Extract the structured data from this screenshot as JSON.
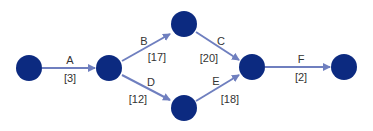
{
  "diagram": {
    "type": "activity-network",
    "colors": {
      "node": "#0c2a80",
      "edge": "#6f7fbf",
      "text": "#333333"
    },
    "nodes": [
      {
        "id": "1",
        "x": 29,
        "y": 68
      },
      {
        "id": "2",
        "x": 109,
        "y": 68
      },
      {
        "id": "3",
        "x": 184,
        "y": 24
      },
      {
        "id": "4",
        "x": 184,
        "y": 108
      },
      {
        "id": "5",
        "x": 252,
        "y": 67
      },
      {
        "id": "6",
        "x": 344,
        "y": 67
      }
    ],
    "edges": [
      {
        "activity": "A",
        "duration": "[3]",
        "from": "1",
        "to": "2"
      },
      {
        "activity": "B",
        "duration": "[17]",
        "from": "2",
        "to": "3"
      },
      {
        "activity": "C",
        "duration": "[20]",
        "from": "3",
        "to": "5"
      },
      {
        "activity": "D",
        "duration": "[12]",
        "from": "2",
        "to": "4"
      },
      {
        "activity": "E",
        "duration": "[18]",
        "from": "4",
        "to": "5"
      },
      {
        "activity": "F",
        "duration": "[2]",
        "from": "5",
        "to": "6"
      }
    ]
  }
}
